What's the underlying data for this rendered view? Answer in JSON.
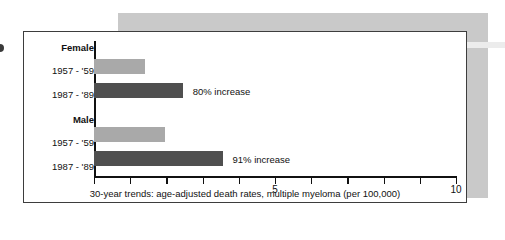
{
  "figure": {
    "caption": "30-year trends: age-adjusted death rates, multiple myeloma (per 100,000)"
  },
  "rows": [
    {
      "label": "Female",
      "type": "group"
    },
    {
      "label": "1957 - '59",
      "type": "bar",
      "series": "1957 - '59",
      "value": 1.4,
      "note": ""
    },
    {
      "label": "1987 - '89",
      "type": "bar",
      "series": "1987 - '89",
      "value": 2.45,
      "note": "80% increase"
    },
    {
      "label": "Male",
      "type": "group"
    },
    {
      "label": "1957 - '59",
      "type": "bar",
      "series": "1957 - '59",
      "value": 1.95,
      "note": ""
    },
    {
      "label": "1987 - '89",
      "type": "bar",
      "series": "1987 - '89",
      "value": 3.55,
      "note": "91% increase"
    }
  ],
  "axis": {
    "ticks": [
      0,
      1,
      2,
      3,
      4,
      5,
      6,
      7,
      8,
      9,
      10
    ],
    "labeled": {
      "5": "5",
      "10": "10"
    }
  },
  "colors": {
    "bar_light": "#a9a9a9",
    "bar_dark": "#4f4f4f",
    "frame": "#3d3d3d",
    "backdrop": "#c9c9c9"
  },
  "chart_data": {
    "type": "bar",
    "orientation": "horizontal",
    "title": "",
    "xlabel": "30-year trends: age-adjusted death rates, multiple myeloma (per 100,000)",
    "ylabel": "",
    "xlim": [
      0,
      10
    ],
    "xticks": [
      0,
      1,
      2,
      3,
      4,
      5,
      6,
      7,
      8,
      9,
      10
    ],
    "xticklabels": [
      "",
      "",
      "",
      "",
      "",
      "5",
      "",
      "",
      "",
      "",
      "10"
    ],
    "grid": false,
    "legend": "none",
    "groups": [
      "Female",
      "Male"
    ],
    "categories": [
      "1957 - '59",
      "1987 - '89"
    ],
    "series": [
      {
        "name": "Female",
        "categories": [
          "1957 - '59",
          "1987 - '89"
        ],
        "values": [
          1.4,
          2.45
        ]
      },
      {
        "name": "Male",
        "categories": [
          "1957 - '59",
          "1987 - '89"
        ],
        "values": [
          1.95,
          3.55
        ]
      }
    ],
    "annotations": [
      {
        "group": "Female",
        "category": "1987 - '89",
        "text": "80% increase"
      },
      {
        "group": "Male",
        "category": "1987 - '89",
        "text": "91% increase"
      }
    ]
  }
}
